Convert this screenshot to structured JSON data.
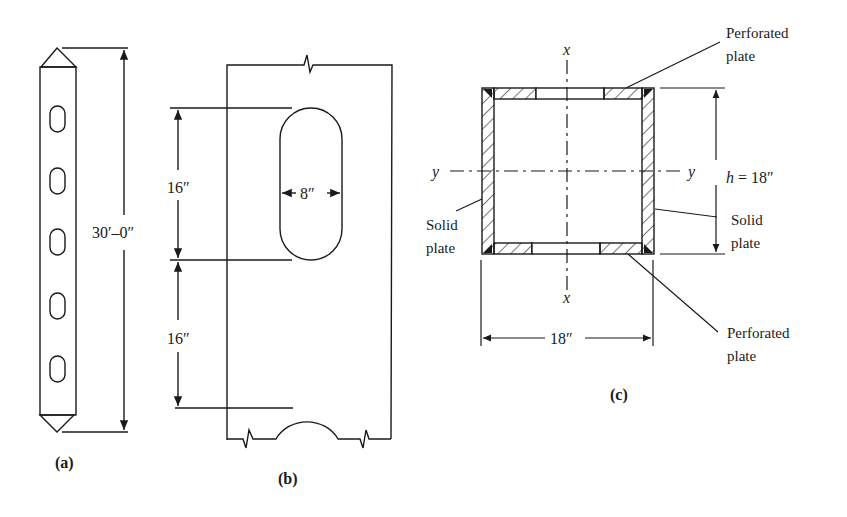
{
  "figure_a": {
    "length_label": "30′–0″",
    "caption": "(a)",
    "slot_count": 5
  },
  "figure_b": {
    "spacing_top_label": "16″",
    "spacing_bottom_label": "16″",
    "slot_width_label": "8″",
    "caption": "(b)"
  },
  "figure_c": {
    "axis_x_top": "x",
    "axis_x_bottom": "x",
    "axis_y_left": "y",
    "axis_y_right": "y",
    "height_label": "h = 18″",
    "width_label": "18″",
    "top_callout": [
      "Perforated",
      "plate"
    ],
    "bottom_callout": [
      "Perforated",
      "plate"
    ],
    "left_callout": [
      "Solid",
      "plate"
    ],
    "right_callout": [
      "Solid",
      "plate"
    ],
    "caption": "(c)"
  },
  "colors": {
    "line": "#1a1a1a",
    "background": "#ffffff"
  }
}
